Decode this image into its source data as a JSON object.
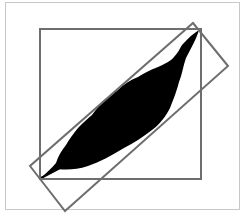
{
  "diagram": {
    "colors": {
      "background": "#ffffff",
      "frame": "#c8c8c8",
      "box_stroke": "#6e6e6e",
      "leaf_fill": "#000000"
    },
    "frame": {
      "x": 5,
      "y": 2,
      "width": 234,
      "height": 207
    },
    "axis_aligned_box": {
      "x": 40,
      "y": 29,
      "width": 161,
      "height": 150
    },
    "rotated_box": {
      "points": "193,23 228,66 65,211 30,166"
    },
    "leaf": {
      "path": "M199,30 C196,40 190,50 186,58 C183,66 182,75 179,82 C177,90 174,98 170,108 C166,116 160,124 152,130 C143,137 134,143 124,148 C112,155 100,162 88,166 C76,170 66,170 58,169 C52,172 46,176 41,178 C46,173 52,168 56,163 C58,156 62,150 66,145 C70,138 74,133 78,128 C84,122 88,118 92,115 C96,110 100,104 104,100 C110,96 114,93 118,90 C124,84 130,80 138,77 C144,73 150,70 158,67 C164,64 170,62 174,57 C178,53 180,48 182,45 C188,38 194,33 199,30 Z",
      "stem": "M41,178 L60,168"
    }
  }
}
